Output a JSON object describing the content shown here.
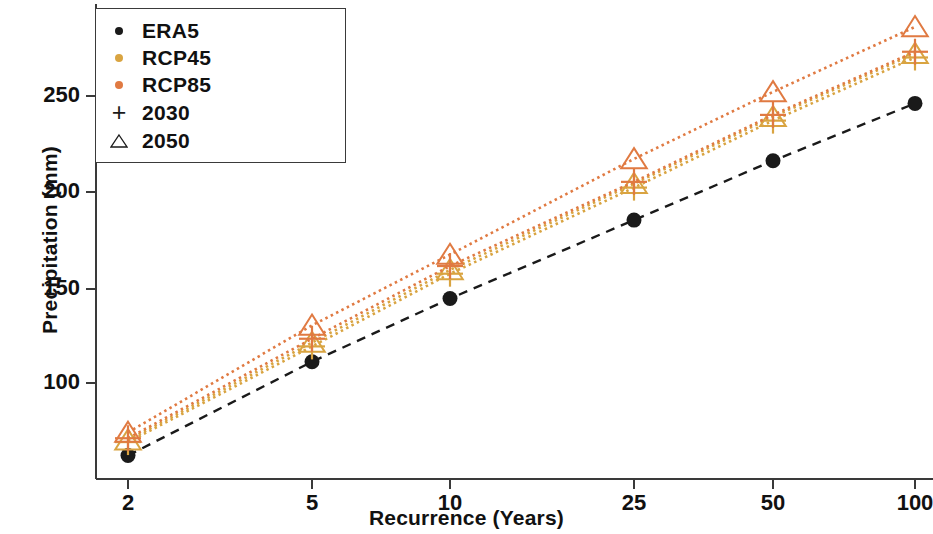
{
  "chart_data": {
    "type": "scatter",
    "title": "",
    "xlabel": "Recurrence (Years)",
    "ylabel": "Precipitation (mm)",
    "x_ticklabels": [
      "2",
      "5",
      "10",
      "25",
      "50",
      "100"
    ],
    "x_tickvalues": [
      2,
      5,
      10,
      25,
      50,
      100
    ],
    "y_ticklabels": [
      "100",
      "150",
      "200",
      "250"
    ],
    "y_tickvalues": [
      100,
      150,
      200,
      250
    ],
    "ylim": [
      45,
      295
    ],
    "grid": false,
    "legend_position": "upper left",
    "legend_entries": [
      {
        "label": "ERA5",
        "marker": "dot",
        "color": "#1a1a1a"
      },
      {
        "label": "RCP45",
        "marker": "dot",
        "color": "#d9a441"
      },
      {
        "label": "RCP85",
        "marker": "dot",
        "color": "#e07a42"
      },
      {
        "label": "2030",
        "marker": "plus",
        "color": "#1a1a1a"
      },
      {
        "label": "2050",
        "marker": "triangle",
        "color": "#1a1a1a"
      }
    ],
    "series": [
      {
        "name": "ERA5",
        "marker": "dot",
        "color": "#1a1a1a",
        "linestyle": "dashed",
        "values": [
          63,
          112,
          145,
          186,
          217,
          247
        ]
      },
      {
        "name": "RCP45 2030",
        "marker": "plus",
        "color": "#d9a441",
        "linestyle": "dotted",
        "values": [
          70,
          120,
          158,
          203,
          238,
          271
        ]
      },
      {
        "name": "RCP45 2050",
        "marker": "triangle",
        "color": "#d9a441",
        "linestyle": "dotted",
        "values": [
          71,
          122,
          160,
          205,
          240,
          273
        ]
      },
      {
        "name": "RCP85 2030",
        "marker": "plus",
        "color": "#e07a42",
        "linestyle": "dotted",
        "values": [
          72,
          124,
          162,
          206,
          241,
          274
        ]
      },
      {
        "name": "RCP85 2050",
        "marker": "triangle",
        "color": "#e07a42",
        "linestyle": "dotted",
        "values": [
          75,
          131,
          168,
          218,
          253,
          287
        ]
      }
    ]
  },
  "axes": {
    "ylabel": "Precipitation (mm)",
    "xlabel": "Recurrence (Years)",
    "yticks": [
      "250",
      "200",
      "150",
      "100"
    ],
    "xticks": [
      "2",
      "5",
      "10",
      "25",
      "50",
      "100"
    ]
  },
  "legend": {
    "items": [
      {
        "label": "ERA5"
      },
      {
        "label": "RCP45"
      },
      {
        "label": "RCP85"
      },
      {
        "label": "2030"
      },
      {
        "label": "2050"
      }
    ]
  },
  "colors": {
    "era5": "#1a1a1a",
    "rcp45": "#d9a441",
    "rcp85": "#e07a42",
    "axis": "#3a3a3a"
  }
}
